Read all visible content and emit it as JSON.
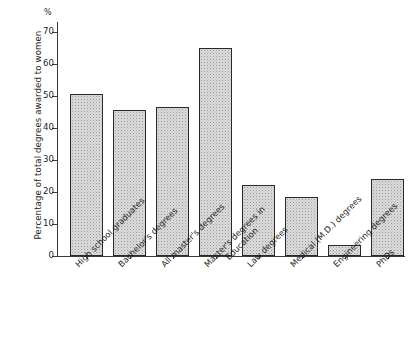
{
  "chart_data": {
    "type": "bar",
    "title": "",
    "subtitle": "",
    "xlabel": "",
    "ylabel": "Percentage of total degrees awarded to women",
    "unit_label": "%",
    "ylim": [
      0,
      73
    ],
    "yticks": [
      0,
      10,
      20,
      30,
      40,
      50,
      60,
      70
    ],
    "ytick_labels": [
      "0",
      "10",
      "20",
      "30",
      "40",
      "50",
      "60",
      "70"
    ],
    "grid": false,
    "legend": null,
    "categories": [
      "High school graduates",
      "Bachelor's degrees",
      "All master's degrees",
      "Master's degrees in Education",
      "Law degrees",
      "Medical (M.D.) degrees",
      "Engineering degrees",
      "PhDs"
    ],
    "category_lines": [
      [
        "High school graduates"
      ],
      [
        "Bachelor's degrees"
      ],
      [
        "All master's degrees"
      ],
      [
        "Master's degrees in",
        "Education"
      ],
      [
        "Law degrees"
      ],
      [
        "Medical (M.D.) degrees"
      ],
      [
        "Engineering degrees"
      ],
      [
        "PhDs"
      ]
    ],
    "values": [
      50.5,
      45.5,
      46.5,
      65.0,
      22.0,
      18.5,
      3.5,
      24.0
    ],
    "colors": {
      "bar_fill": "#dcdcdc",
      "bar_stipple": "#9a9a9a",
      "bar_border": "#2b2829",
      "axis": "#3c3a3b",
      "text": "#231f20",
      "background": "#ffffff"
    }
  }
}
